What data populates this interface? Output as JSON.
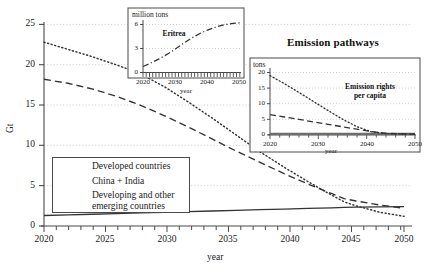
{
  "figure": {
    "title": "Emission pathways",
    "width": 428,
    "height": 275,
    "background": "#ffffff",
    "line_color": "#333333",
    "grid_color": "#bdbdbd",
    "axis_color": "#4a4a4a"
  },
  "main_axes": {
    "ylabel": "Gt",
    "xlabel": "year",
    "yticks": [
      "0",
      "5",
      "10",
      "15",
      "20",
      "25"
    ],
    "xticks": [
      "2020",
      "2025",
      "2030",
      "2035",
      "2040",
      "2045",
      "2050"
    ]
  },
  "legend": {
    "items": [
      {
        "label": "Developed countries",
        "style": "dotted"
      },
      {
        "label": "China + India",
        "style": "dashed"
      },
      {
        "label": "Developing and other",
        "label2": "emerging countries",
        "style": "solid"
      }
    ]
  },
  "inset_eritrea": {
    "unit": "million tons",
    "note": "Eritrea",
    "xlabel": "year",
    "yticks": [
      "0",
      "3",
      "6"
    ],
    "xticks": [
      "2020",
      "2030",
      "2040",
      "2050"
    ]
  },
  "inset_percapita": {
    "unit": "tons",
    "note_line1": "Emission rights",
    "note_line2": "per capita",
    "xlabel": "year",
    "yticks": [
      "0",
      "5",
      "10",
      "15",
      "20"
    ],
    "xticks": [
      "2020",
      "2030",
      "2040",
      "2050"
    ]
  },
  "chart_data": {
    "type": "line",
    "title": "Emission pathways",
    "xlabel": "year",
    "ylabel": "Gt",
    "xlim": [
      2020,
      2050
    ],
    "ylim": [
      0,
      25
    ],
    "grid": true,
    "legend_position": "lower-left-inside",
    "x": [
      2020,
      2022,
      2024,
      2026,
      2028,
      2030,
      2032,
      2034,
      2036,
      2038,
      2040,
      2042,
      2044,
      2045,
      2046,
      2048,
      2050
    ],
    "series": [
      {
        "name": "Developed countries",
        "style": "dotted",
        "values": [
          22.8,
          21.9,
          21.0,
          20.0,
          18.9,
          17.3,
          15.4,
          13.4,
          11.3,
          9.2,
          7.3,
          5.5,
          3.8,
          3.0,
          2.5,
          1.7,
          1.2
        ]
      },
      {
        "name": "China + India",
        "style": "dashed",
        "values": [
          18.2,
          17.7,
          17.0,
          16.1,
          15.0,
          13.7,
          12.3,
          10.8,
          9.3,
          7.9,
          6.5,
          5.2,
          4.0,
          3.4,
          3.1,
          2.6,
          2.2
        ]
      },
      {
        "name": "Developing and other emerging countries",
        "style": "solid",
        "values": [
          1.3,
          1.38,
          1.46,
          1.54,
          1.62,
          1.7,
          1.78,
          1.86,
          1.94,
          2.02,
          2.1,
          2.18,
          2.26,
          2.3,
          2.33,
          2.37,
          2.4
        ]
      }
    ],
    "insets": [
      {
        "name": "Eritrea",
        "type": "line",
        "ylabel": "million tons",
        "xlabel": "year",
        "xlim": [
          2020,
          2050
        ],
        "ylim": [
          0,
          6.6
        ],
        "yticks": [
          0,
          3,
          6
        ],
        "xticks": [
          2020,
          2030,
          2040,
          2050
        ],
        "style": "dash-dot",
        "x": [
          2020,
          2022,
          2025,
          2028,
          2030,
          2032,
          2035,
          2038,
          2040,
          2043,
          2045,
          2048,
          2050
        ],
        "values": [
          0.75,
          1.1,
          1.7,
          2.4,
          2.95,
          3.5,
          4.3,
          4.95,
          5.3,
          5.75,
          5.95,
          6.15,
          6.2
        ]
      },
      {
        "name": "Emission rights per capita",
        "type": "line",
        "ylabel": "tons",
        "xlabel": "year",
        "xlim": [
          2020,
          2050
        ],
        "ylim": [
          0,
          20.8
        ],
        "yticks": [
          0,
          5,
          10,
          15,
          20
        ],
        "xticks": [
          2020,
          2030,
          2040,
          2050
        ],
        "series": [
          {
            "name": "Developed countries",
            "style": "dotted",
            "values": [
              19.0,
              16.4,
              13.6,
              10.7,
              7.8,
              5.0,
              2.6,
              1.0,
              0.45,
              0.3,
              0.25
            ]
          },
          {
            "name": "China + India",
            "style": "dashed",
            "values": [
              6.5,
              5.8,
              5.0,
              4.2,
              3.4,
              2.6,
              1.8,
              1.0,
              0.5,
              0.3,
              0.22
            ]
          },
          {
            "name": "Developing and other emerging countries",
            "style": "solid-thick",
            "values": [
              0.28,
              0.28,
              0.28,
              0.28,
              0.28,
              0.28,
              0.28,
              0.28,
              0.28,
              0.28,
              0.28
            ]
          }
        ],
        "x": [
          2020,
          2023,
          2026,
          2029,
          2032,
          2035,
          2038,
          2041,
          2044,
          2047,
          2050
        ]
      }
    ]
  }
}
